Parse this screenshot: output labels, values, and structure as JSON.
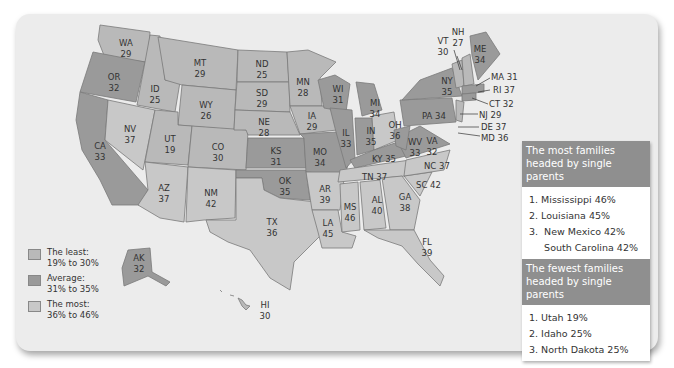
{
  "legend": [
    {
      "label": "The least:",
      "range": "19% to 30%",
      "color": "#b9b9b9"
    },
    {
      "label": "Average:",
      "range": "31% to 35%",
      "color": "#9a9a9a"
    },
    {
      "label": "The most:",
      "range": "36% to 46%",
      "color": "#c8c8c8"
    }
  ],
  "most": {
    "heading": "The most families headed by single parents",
    "items": [
      "1. Mississippi 46%",
      "2. Louisiana 45%",
      "3.  New Mexico 42%",
      "     South Carolina 42%"
    ]
  },
  "fewest": {
    "heading": "The fewest families headed by single parents",
    "items": [
      "1. Utah 19%",
      "2. Idaho 25%",
      "3. North Dakota 25%"
    ]
  },
  "states": {
    "WA": {
      "abbr": "WA",
      "value": "29"
    },
    "OR": {
      "abbr": "OR",
      "value": "32"
    },
    "CA": {
      "abbr": "CA",
      "value": "33"
    },
    "ID": {
      "abbr": "ID",
      "value": "25"
    },
    "NV": {
      "abbr": "NV",
      "value": "37"
    },
    "MT": {
      "abbr": "MT",
      "value": "29"
    },
    "WY": {
      "abbr": "WY",
      "value": "26"
    },
    "UT": {
      "abbr": "UT",
      "value": "19"
    },
    "CO": {
      "abbr": "CO",
      "value": "30"
    },
    "AZ": {
      "abbr": "AZ",
      "value": "37"
    },
    "NM": {
      "abbr": "NM",
      "value": "42"
    },
    "ND": {
      "abbr": "ND",
      "value": "25"
    },
    "SD": {
      "abbr": "SD",
      "value": "29"
    },
    "NE": {
      "abbr": "NE",
      "value": "28"
    },
    "KS": {
      "abbr": "KS",
      "value": "31"
    },
    "OK": {
      "abbr": "OK",
      "value": "35"
    },
    "TX": {
      "abbr": "TX",
      "value": "36"
    },
    "MN": {
      "abbr": "MN",
      "value": "28"
    },
    "IA": {
      "abbr": "IA",
      "value": "29"
    },
    "MO": {
      "abbr": "MO",
      "value": "34"
    },
    "AR": {
      "abbr": "AR",
      "value": "39"
    },
    "LA": {
      "abbr": "LA",
      "value": "45"
    },
    "WI": {
      "abbr": "WI",
      "value": "31"
    },
    "IL": {
      "abbr": "IL",
      "value": "33"
    },
    "MI": {
      "abbr": "MI",
      "value": "34"
    },
    "IN": {
      "abbr": "IN",
      "value": "35"
    },
    "OH": {
      "abbr": "OH",
      "value": "36"
    },
    "KY": {
      "abbr": "KY",
      "value": "35"
    },
    "TN": {
      "abbr": "TN",
      "value": "37"
    },
    "MS": {
      "abbr": "MS",
      "value": "46"
    },
    "AL": {
      "abbr": "AL",
      "value": "40"
    },
    "GA": {
      "abbr": "GA",
      "value": "38"
    },
    "FL": {
      "abbr": "FL",
      "value": "39"
    },
    "SC": {
      "abbr": "SC",
      "value": "42"
    },
    "NC": {
      "abbr": "NC",
      "value": "37"
    },
    "VA": {
      "abbr": "VA",
      "value": "32"
    },
    "WV": {
      "abbr": "WV",
      "value": "33"
    },
    "PA": {
      "abbr": "PA",
      "value": "34"
    },
    "NY": {
      "abbr": "NY",
      "value": "35"
    },
    "VT": {
      "abbr": "VT",
      "value": "30"
    },
    "NH": {
      "abbr": "NH",
      "value": "27"
    },
    "ME": {
      "abbr": "ME",
      "value": "34"
    },
    "MA": {
      "abbr": "MA",
      "value": "31"
    },
    "RI": {
      "abbr": "RI",
      "value": "37"
    },
    "CT": {
      "abbr": "CT",
      "value": "32"
    },
    "NJ": {
      "abbr": "NJ",
      "value": "29"
    },
    "DE": {
      "abbr": "DE",
      "value": "37"
    },
    "MD": {
      "abbr": "MD",
      "value": "36"
    },
    "AK": {
      "abbr": "AK",
      "value": "32"
    },
    "HI": {
      "abbr": "HI",
      "value": "30"
    }
  },
  "callouts": {
    "MA": "MA 31",
    "RI": "RI 37",
    "CT": "CT 32",
    "NJ": "NJ 29",
    "DE": "DE 37",
    "MD": "MD 36",
    "PA": "PA 34",
    "KY": "KY 35",
    "TN": "TN 37",
    "NC": "NC 37",
    "SC": "SC 42"
  }
}
